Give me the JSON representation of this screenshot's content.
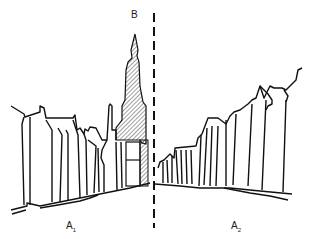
{
  "diagram": {
    "type": "perspective street elevation sketch",
    "labels": {
      "b": "B",
      "a1_main": "A",
      "a1_sub": "1",
      "a2_main": "A",
      "a2_sub": "2"
    },
    "elements": [
      {
        "id": "tower",
        "description": "Hatched church spire at end of street, labeled B"
      },
      {
        "id": "left-facades",
        "description": "Row of gabled building facades on left side, labeled A1"
      },
      {
        "id": "right-facades",
        "description": "Row of gabled building facades on right side, labeled A2"
      },
      {
        "id": "axis",
        "description": "Vertical dashed center line splitting the view"
      }
    ],
    "colors": {
      "ink": "#111111",
      "background": "#ffffff"
    }
  }
}
